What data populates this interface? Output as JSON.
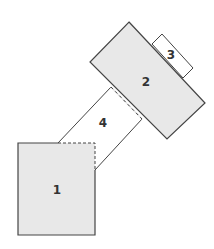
{
  "diagram": {
    "type": "floor-plan",
    "colors": {
      "fill": "#e8e8e8",
      "stroke": "#444444",
      "background": "#ffffff"
    },
    "rooms": [
      {
        "id": "1",
        "label": "1",
        "shaded": true
      },
      {
        "id": "2",
        "label": "2",
        "shaded": true
      },
      {
        "id": "3",
        "label": "3",
        "shaded": false
      },
      {
        "id": "4",
        "label": "4",
        "shaded": false
      }
    ]
  }
}
